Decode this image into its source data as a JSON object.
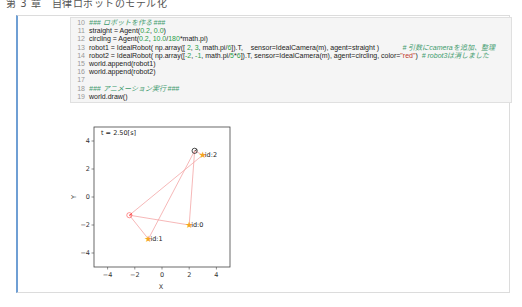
{
  "page_header": "第 3 章　自律ロボットのモデル化",
  "code_cell": {
    "lines": [
      {
        "n": "10",
        "parts": [
          {
            "t": "### ロボットを作る ###",
            "c": "cmt"
          }
        ]
      },
      {
        "n": "11",
        "parts": [
          {
            "t": "straight = Agent(",
            "c": ""
          },
          {
            "t": "0.2",
            "c": "num"
          },
          {
            "t": ", ",
            "c": ""
          },
          {
            "t": "0.0",
            "c": "num"
          },
          {
            "t": ")",
            "c": ""
          }
        ]
      },
      {
        "n": "12",
        "parts": [
          {
            "t": "circling = Agent(",
            "c": ""
          },
          {
            "t": "0.2",
            "c": "num"
          },
          {
            "t": ", ",
            "c": ""
          },
          {
            "t": "10.0",
            "c": "num"
          },
          {
            "t": "/",
            "c": ""
          },
          {
            "t": "180",
            "c": "num"
          },
          {
            "t": "*math.pi)",
            "c": ""
          }
        ]
      },
      {
        "n": "13",
        "parts": [
          {
            "t": "robot1 = IdealRobot( np.array([ ",
            "c": ""
          },
          {
            "t": "2",
            "c": "num"
          },
          {
            "t": ", ",
            "c": ""
          },
          {
            "t": "3",
            "c": "num"
          },
          {
            "t": ", math.pi/",
            "c": ""
          },
          {
            "t": "6",
            "c": "num"
          },
          {
            "t": "]).T,    sensor=IdealCamera(m), agent=straight )            ",
            "c": ""
          },
          {
            "t": "# 引数にcameraを追加、整理",
            "c": "cmt"
          }
        ]
      },
      {
        "n": "14",
        "parts": [
          {
            "t": "robot2 = IdealRobot( np.array([",
            "c": ""
          },
          {
            "t": "-2",
            "c": "num"
          },
          {
            "t": ", ",
            "c": ""
          },
          {
            "t": "-1",
            "c": "num"
          },
          {
            "t": ", math.pi/",
            "c": ""
          },
          {
            "t": "5",
            "c": "num"
          },
          {
            "t": "*",
            "c": ""
          },
          {
            "t": "6",
            "c": "num"
          },
          {
            "t": "]).T, sensor=IdealCamera(m), agent=circling, color=",
            "c": ""
          },
          {
            "t": "\"red\"",
            "c": "str"
          },
          {
            "t": ")  ",
            "c": ""
          },
          {
            "t": "# robot3は消しました",
            "c": "cmt"
          }
        ]
      },
      {
        "n": "15",
        "parts": [
          {
            "t": "world.append(robot1)",
            "c": ""
          }
        ]
      },
      {
        "n": "16",
        "parts": [
          {
            "t": "world.append(robot2)",
            "c": ""
          }
        ]
      },
      {
        "n": "17",
        "parts": [
          {
            "t": "",
            "c": ""
          }
        ]
      },
      {
        "n": "18",
        "parts": [
          {
            "t": "### アニメーション実行 ###",
            "c": "cmt"
          }
        ]
      },
      {
        "n": "19",
        "parts": [
          {
            "t": "world.draw()",
            "c": ""
          }
        ]
      }
    ]
  },
  "plot": {
    "time_label": "t = 2.50[s]",
    "xlabel": "X",
    "ylabel": "Y",
    "xticks": [
      "−4",
      "−2",
      "0",
      "2",
      "4"
    ],
    "yticks": [
      "4",
      "2",
      "0",
      "−2",
      "−4"
    ]
  },
  "chart_data": {
    "type": "scatter",
    "title": "t = 2.50[s]",
    "xlabel": "X",
    "ylabel": "Y",
    "xlim": [
      -5,
      5
    ],
    "ylim": [
      -5,
      5
    ],
    "xticks": [
      -4,
      -2,
      0,
      2,
      4
    ],
    "yticks": [
      -4,
      -2,
      0,
      2,
      4
    ],
    "landmarks": [
      {
        "id": "id:0",
        "x": 2,
        "y": -2
      },
      {
        "id": "id:1",
        "x": -1,
        "y": -3
      },
      {
        "id": "id:2",
        "x": 3,
        "y": 3
      }
    ],
    "robots": [
      {
        "name": "robot1",
        "color": "#000000",
        "x": 2.4,
        "y": 3.3,
        "observes": [
          "id:0",
          "id:1",
          "id:2"
        ]
      },
      {
        "name": "robot2",
        "color": "#ff0000",
        "x": -2.4,
        "y": -1.3,
        "observes": [
          "id:0",
          "id:1",
          "id:2"
        ]
      }
    ],
    "landmark_color": "#f5a623",
    "observation_line_color": "#f4a6a6"
  }
}
